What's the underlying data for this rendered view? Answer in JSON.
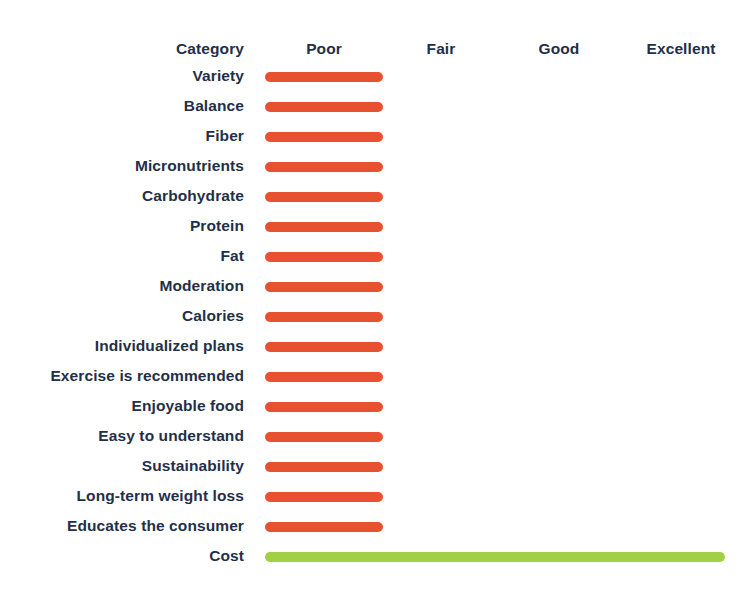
{
  "chart_data": {
    "type": "bar",
    "orientation": "horizontal",
    "title": "",
    "xlabel": "",
    "ylabel": "Category",
    "grid": false,
    "legend": null,
    "scale_labels": [
      "Poor",
      "Fair",
      "Good",
      "Excellent"
    ],
    "scale_values": [
      1,
      2,
      3,
      4
    ],
    "xlim": [
      0,
      4
    ],
    "category_header": "Category",
    "colors": {
      "poor": "#e8512f",
      "excellent": "#a2d045",
      "text": "#1f3048",
      "background": "#ffffff"
    },
    "categories": [
      "Variety",
      "Balance",
      "Fiber",
      "Micronutrients",
      "Carbohydrate",
      "Protein",
      "Fat",
      "Moderation",
      "Calories",
      "Individualized plans",
      "Exercise is recommended",
      "Enjoyable food",
      "Easy to understand",
      "Sustainability",
      "Long-term weight loss",
      "Educates the consumer",
      "Cost"
    ],
    "values": [
      1,
      1,
      1,
      1,
      1,
      1,
      1,
      1,
      1,
      1,
      1,
      1,
      1,
      1,
      1,
      1,
      4
    ],
    "ratings": [
      "Poor",
      "Poor",
      "Poor",
      "Poor",
      "Poor",
      "Poor",
      "Poor",
      "Poor",
      "Poor",
      "Poor",
      "Poor",
      "Poor",
      "Poor",
      "Poor",
      "Poor",
      "Poor",
      "Excellent"
    ],
    "rows": [
      {
        "label": "Variety",
        "rating": "Poor",
        "value": 1,
        "color": "#e8512f"
      },
      {
        "label": "Balance",
        "rating": "Poor",
        "value": 1,
        "color": "#e8512f"
      },
      {
        "label": "Fiber",
        "rating": "Poor",
        "value": 1,
        "color": "#e8512f"
      },
      {
        "label": "Micronutrients",
        "rating": "Poor",
        "value": 1,
        "color": "#e8512f"
      },
      {
        "label": "Carbohydrate",
        "rating": "Poor",
        "value": 1,
        "color": "#e8512f"
      },
      {
        "label": "Protein",
        "rating": "Poor",
        "value": 1,
        "color": "#e8512f"
      },
      {
        "label": "Fat",
        "rating": "Poor",
        "value": 1,
        "color": "#e8512f"
      },
      {
        "label": "Moderation",
        "rating": "Poor",
        "value": 1,
        "color": "#e8512f"
      },
      {
        "label": "Calories",
        "rating": "Poor",
        "value": 1,
        "color": "#e8512f"
      },
      {
        "label": "Individualized plans",
        "rating": "Poor",
        "value": 1,
        "color": "#e8512f"
      },
      {
        "label": "Exercise is recommended",
        "rating": "Poor",
        "value": 1,
        "color": "#e8512f"
      },
      {
        "label": "Enjoyable food",
        "rating": "Poor",
        "value": 1,
        "color": "#e8512f"
      },
      {
        "label": "Easy to understand",
        "rating": "Poor",
        "value": 1,
        "color": "#e8512f"
      },
      {
        "label": "Sustainability",
        "rating": "Poor",
        "value": 1,
        "color": "#e8512f"
      },
      {
        "label": "Long-term weight loss",
        "rating": "Poor",
        "value": 1,
        "color": "#e8512f"
      },
      {
        "label": "Educates the consumer",
        "rating": "Poor",
        "value": 1,
        "color": "#e8512f"
      },
      {
        "label": "Cost",
        "rating": "Excellent",
        "value": 4,
        "color": "#a2d045"
      }
    ]
  },
  "layout": {
    "axis_centers_px": [
      324,
      441,
      559,
      681
    ],
    "bar_left_px": 265,
    "bar_poor_right_px": 383,
    "bar_excellent_right_px": 725
  }
}
